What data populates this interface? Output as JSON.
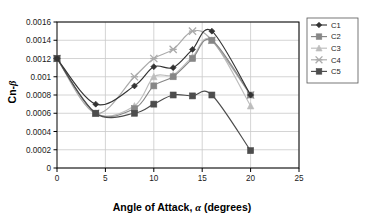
{
  "chart_data": {
    "type": "line",
    "title": "",
    "xlabel": "Angle of Attack, α (degrees)",
    "ylabel": "Cn-β",
    "ylabel_prefix": "Cn-",
    "ylabel_symbol": "β",
    "xlabel_prefix": "Angle of Attack, ",
    "xlabel_symbol": "α",
    "xlabel_suffix": " (degrees)",
    "x": [
      0,
      4,
      8,
      10,
      12,
      14,
      16,
      20
    ],
    "xlim": [
      0,
      25
    ],
    "ylim": [
      0,
      0.0016
    ],
    "xticks": [
      0,
      5,
      10,
      15,
      20,
      25
    ],
    "xtick_labels": [
      "0",
      "5",
      "10",
      "15",
      "20",
      "25"
    ],
    "yticks": [
      0,
      0.0002,
      0.0004,
      0.0006,
      0.0008,
      0.001,
      0.0012,
      0.0014,
      0.0016
    ],
    "ytick_labels": [
      "0",
      "0.0002",
      "0.0004",
      "0.0006",
      "0.0008",
      "0.001",
      "0.0012",
      "0.0014",
      "0.0016"
    ],
    "grid": "horizontal-and-vertical",
    "legend_position": "right",
    "series": [
      {
        "name": "C1",
        "marker": "diamond",
        "color": "#333333",
        "values": [
          0.0012,
          0.0007,
          0.0009,
          0.00111,
          0.0011,
          0.0013,
          0.0015,
          0.0008
        ]
      },
      {
        "name": "C2",
        "marker": "square",
        "color": "#878787",
        "values": [
          0.0012,
          0.0006,
          0.00065,
          0.0009,
          0.001,
          0.0012,
          0.0014,
          0.0008
        ]
      },
      {
        "name": "C3",
        "marker": "triangle",
        "color": "#bdbdbd",
        "values": [
          0.0012,
          0.0006,
          0.00068,
          0.001,
          0.00102,
          0.00122,
          0.0014,
          0.00068
        ]
      },
      {
        "name": "C4",
        "marker": "cross",
        "color": "#aaaaaa",
        "values": [
          0.0012,
          0.0006,
          0.001,
          0.0012,
          0.0013,
          0.0015,
          0.0014,
          0.0008
        ]
      },
      {
        "name": "C5",
        "marker": "square",
        "color": "#4d4d4d",
        "values": [
          0.0012,
          0.0006,
          0.0006,
          0.0007,
          0.0008,
          0.00079,
          0.0008,
          0.00019
        ]
      }
    ]
  },
  "legend": {
    "entries": [
      {
        "label": "C1"
      },
      {
        "label": "C2"
      },
      {
        "label": "C3"
      },
      {
        "label": "C4"
      },
      {
        "label": "C5"
      }
    ]
  },
  "colors": {
    "plot_border": "#000000",
    "gridline": "#c9c9c9",
    "background": "#ffffff",
    "legend_border": "#555555"
  }
}
